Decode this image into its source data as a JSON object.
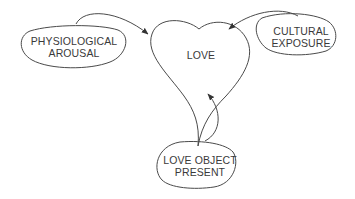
{
  "diagram": {
    "center": {
      "label": "LOVE",
      "shape": "heart"
    },
    "nodes": [
      {
        "id": "physio",
        "line1": "PHYSIOLOGICAL",
        "line2": "AROUSAL"
      },
      {
        "id": "cultural",
        "line1": "CULTURAL",
        "line2": "EXPOSURE"
      },
      {
        "id": "object",
        "line1": "LOVE OBJECT",
        "line2": "PRESENT"
      }
    ],
    "edges": [
      {
        "from": "physio",
        "to": "love"
      },
      {
        "from": "cultural",
        "to": "love"
      },
      {
        "from": "object",
        "to": "love"
      }
    ],
    "colors": {
      "stroke": "#4a4a4a",
      "text": "#3a3a3a",
      "background": "#ffffff"
    }
  }
}
